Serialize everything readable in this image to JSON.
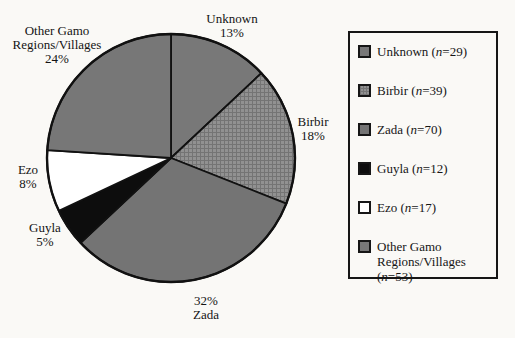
{
  "page": {
    "background": "#faf9f6"
  },
  "chart_data": {
    "type": "pie",
    "title": "",
    "categories": [
      "Unknown",
      "Birbir",
      "Zada",
      "Guyla",
      "Ezo",
      "Other Gamo Regions/Villages"
    ],
    "values_percent": [
      13,
      18,
      32,
      5,
      8,
      24
    ],
    "counts": [
      29,
      39,
      70,
      12,
      17,
      53
    ],
    "total_n": 220,
    "start_angle_deg": 0,
    "direction": "clockwise",
    "slice_fills": [
      "#787878",
      "crosshatch",
      "#747474",
      "#0d0d0d",
      "#ffffff",
      "#777777"
    ],
    "crosshatch_base": "#919191",
    "crosshatch_line": "#747474",
    "outline_color": "#111111",
    "geometry": {
      "cx": 171,
      "cy": 158,
      "r": 124
    },
    "legend_position": "right"
  },
  "pie_labels": [
    {
      "name": "unknown",
      "text": "Unknown\n13%"
    },
    {
      "name": "birbir",
      "text": "Birbir\n18%"
    },
    {
      "name": "zada",
      "text": "32%\nZada"
    },
    {
      "name": "guyla",
      "text": "Guyla\n5%"
    },
    {
      "name": "ezo",
      "text": "Ezo\n8%"
    },
    {
      "name": "other-gamo",
      "text": "Other Gamo\nRegions/Villages\n24%"
    }
  ],
  "legend": {
    "items": [
      {
        "label": "Unknown (n=29)"
      },
      {
        "label": "Birbir (n=39)"
      },
      {
        "label": "Zada (n=70)"
      },
      {
        "label": "Guyla (n=12)"
      },
      {
        "label": "Ezo (n=17)"
      },
      {
        "label": "Other Gamo\nRegions/Villages (n=53)"
      }
    ]
  }
}
